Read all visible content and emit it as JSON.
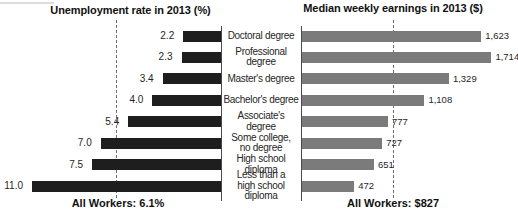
{
  "chart_data": {
    "type": "bar",
    "layout": "bidirectional-horizontal",
    "grid": false,
    "legend": false,
    "categories": [
      "Doctoral degree",
      "Professional degree",
      "Master's degree",
      "Bachelor's degree",
      "Associate's degree",
      "Some college,\nno degree",
      "High school diploma",
      "Less than a\nhigh school diploma"
    ],
    "series": [
      {
        "name": "Unemployment rate in 2013 (%)",
        "side": "left",
        "values": [
          2.2,
          2.3,
          3.4,
          4.0,
          5.4,
          7.0,
          7.5,
          11.0
        ],
        "value_labels": [
          "2.2",
          "2.3",
          "3.4",
          "4.0",
          "5.4",
          "7.0",
          "7.5",
          "11.0"
        ],
        "bar_color": "#1e1e1e",
        "reference_line": {
          "value": 6.1,
          "label": "All Workers: 6.1%"
        }
      },
      {
        "name": "Median weekly earnings in 2013 ($)",
        "side": "right",
        "values": [
          1623,
          1714,
          1329,
          1108,
          777,
          727,
          651,
          472
        ],
        "value_labels": [
          "1,623",
          "1,714",
          "1,329",
          "1,108",
          "777",
          "727",
          "651",
          "472"
        ],
        "bar_color": "#7b7b7b",
        "reference_line": {
          "value": 827,
          "label": "All Workers: $827"
        }
      }
    ]
  },
  "colors": {
    "axis": "#4a4a4a",
    "reference_dash": "#6e6e6e",
    "value_text": "#1f1f1f",
    "category_text": "#262626",
    "background": "#ffffff"
  }
}
